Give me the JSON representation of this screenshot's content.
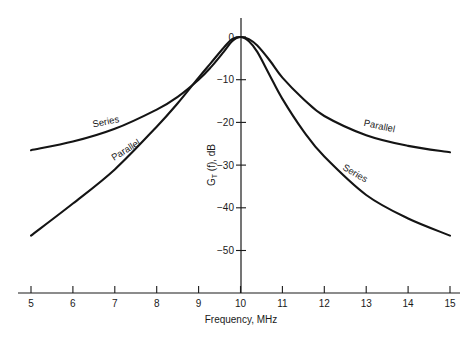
{
  "chart_data": {
    "type": "line",
    "title": "",
    "xlabel": "Frequency, MHz",
    "ylabel": "G_T (f), dB",
    "ylabel_main": "G",
    "ylabel_sub": "T",
    "ylabel_rest": " (f), dB",
    "xlim": [
      5,
      15
    ],
    "ylim": [
      -55,
      0
    ],
    "grid": false,
    "legend": "inline curve labels",
    "x_ticks": [
      5,
      6,
      7,
      8,
      9,
      10,
      11,
      12,
      13,
      14,
      15
    ],
    "x_tick_labels": [
      "5",
      "6",
      "7",
      "8",
      "9",
      "10",
      "11",
      "12",
      "13",
      "14",
      "15"
    ],
    "y_ticks": [
      0,
      -10,
      -20,
      -30,
      -40,
      -50
    ],
    "y_tick_labels": [
      "0",
      "−10",
      "−20",
      "−30",
      "−40",
      "−50"
    ],
    "x": [
      5,
      6,
      7,
      8,
      8.5,
      9,
      9.3,
      9.6,
      9.8,
      10,
      10.2,
      10.4,
      10.7,
      11,
      11.5,
      12,
      13,
      14,
      15
    ],
    "series": [
      {
        "name": "Series",
        "values": [
          -26.5,
          -24.5,
          -21.5,
          -17,
          -14,
          -10,
          -7,
          -3.5,
          -1,
          0,
          -1,
          -3.5,
          -9,
          -14.5,
          -22,
          -28,
          -37,
          -42.5,
          -46.5
        ]
      },
      {
        "name": "Parallel",
        "values": [
          -46.5,
          -39,
          -31,
          -21,
          -15.5,
          -9.5,
          -6,
          -2.5,
          -0.5,
          0,
          -0.5,
          -2,
          -5.5,
          -9.5,
          -14.5,
          -18.5,
          -23,
          -25.5,
          -27
        ]
      }
    ],
    "annotations": [
      {
        "text": "Series",
        "near_x": 6.8,
        "near_y": -21.5,
        "side": "left"
      },
      {
        "text": "Parallel",
        "near_x": 7.3,
        "near_y": -28,
        "side": "left"
      },
      {
        "text": "Parallel",
        "near_x": 13.3,
        "near_y": -22.5,
        "side": "right"
      },
      {
        "text": "Series",
        "near_x": 12.7,
        "near_y": -33.5,
        "side": "right"
      }
    ]
  }
}
